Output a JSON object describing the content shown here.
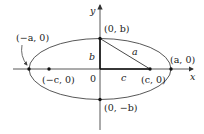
{
  "diagram": {
    "type": "ellipse-foci",
    "axes": {
      "x_label": "x",
      "y_label": "y",
      "origin_label": "0"
    },
    "points": {
      "left_vertex": "(−a, 0)",
      "right_vertex": "(a, 0)",
      "top_covertex": "(0, b)",
      "bottom_covertex": "(0, −b)",
      "left_focus": "(−c, 0)",
      "right_focus": "(c, 0)"
    },
    "segments": {
      "vertical": "b",
      "horizontal": "c",
      "hypotenuse": "a"
    },
    "colors": {
      "stroke": "#333333",
      "text": "#222222",
      "background": "#ffffff"
    }
  }
}
